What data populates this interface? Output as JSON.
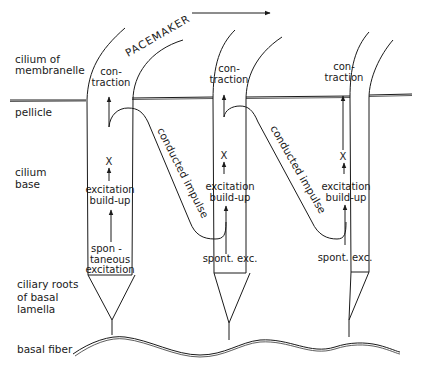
{
  "diagram": {
    "title_label": "PACEMAKER",
    "direction_arrow": "left-to-right",
    "side_labels": {
      "cilium_of_membranelle": [
        "cilium of",
        "membranelle"
      ],
      "pellicle": "pellicle",
      "cilium_base": [
        "cilium",
        "base"
      ],
      "ciliary_roots": [
        "ciliary roots",
        "of basal",
        "lamella"
      ],
      "basal_fiber": "basal fiber"
    },
    "cilia": [
      {
        "contraction": [
          "con-",
          "traction"
        ],
        "x_marker": "X",
        "build_up": [
          "excitation",
          "build-up"
        ],
        "excitation": [
          "spon -",
          "taneous",
          "excitation"
        ]
      },
      {
        "contraction": [
          "con-",
          "traction"
        ],
        "x_marker": "X",
        "build_up": [
          "excitation",
          "build-up"
        ],
        "excitation": [
          "spont. exc."
        ]
      },
      {
        "contraction": [
          "con-",
          "traction"
        ],
        "x_marker": "X",
        "build_up": [
          "excitation",
          "build-up"
        ],
        "excitation": [
          "spont. exc."
        ]
      }
    ],
    "conducted_impulse_label": "conducted impulse",
    "colors": {
      "ink": "#1a1a1a",
      "background": "#ffffff"
    }
  }
}
